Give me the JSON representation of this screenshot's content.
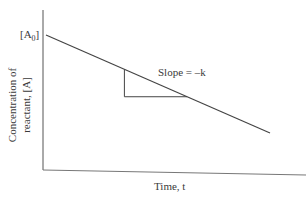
{
  "chart_data": {
    "type": "line",
    "title": "",
    "xlabel": "Time, t",
    "ylabel_lines": [
      "Concentration of",
      "reactant, [A]"
    ],
    "y_intercept_label": "[A0]",
    "y_intercept_label_main": "[A",
    "y_intercept_label_sub": "0",
    "y_intercept_label_close": "]",
    "annotation": "Slope = –k",
    "series": [
      {
        "name": "[A] vs t",
        "x": [
          0,
          1
        ],
        "y": [
          1,
          0.38
        ]
      }
    ],
    "slope_triangle": {
      "x_start": 0.35,
      "x_end": 0.63
    },
    "xlim": [
      0,
      1.15
    ],
    "ylim": [
      0,
      1.15
    ],
    "grid": false,
    "ticks": false
  }
}
